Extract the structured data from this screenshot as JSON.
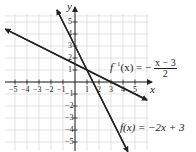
{
  "chart_data": {
    "type": "line",
    "title": "",
    "xlabel": "x",
    "ylabel": "y",
    "xlim": [
      -6,
      6
    ],
    "ylim": [
      -5.5,
      6
    ],
    "grid": true,
    "x_ticks": [
      "-5",
      "-4",
      "-3",
      "-2",
      "-1",
      "1",
      "2",
      "3",
      "4",
      "5"
    ],
    "y_ticks": [
      "5",
      "4",
      "3",
      "2",
      "1",
      "-1",
      "-2",
      "-3",
      "-4",
      "-5"
    ],
    "series": [
      {
        "name": "f(x) = -2x + 3",
        "equation": "f(x) = -2x + 3",
        "slope": -2,
        "intercept": 3,
        "points": [
          [
            -1.5,
            6
          ],
          [
            0,
            3
          ],
          [
            1,
            1
          ],
          [
            1.5,
            0
          ],
          [
            4.4,
            -5.8
          ]
        ],
        "color": "#222222"
      },
      {
        "name": "f^{-1}(x) = -(x-3)/2",
        "equation": "f^{-1}(x) = -(x - 3)/2",
        "slope": -0.5,
        "intercept": 1.5,
        "points": [
          [
            -5.8,
            4.4
          ],
          [
            0,
            1.5
          ],
          [
            1,
            1
          ],
          [
            3,
            0
          ],
          [
            6,
            -1.5
          ]
        ],
        "color": "#222222"
      }
    ],
    "annotations": [
      {
        "text": "f^{-1}(x) = -(x - 3)/2",
        "near": [
          3.5,
          1
        ]
      },
      {
        "text": "f(x) = -2x + 3",
        "near": [
          3.5,
          -4
        ]
      }
    ]
  },
  "labels": {
    "x_axis": "x",
    "y_axis": "y",
    "finv_prefix": "f",
    "finv_sup": "−1",
    "finv_arg": "(x) = −",
    "finv_num": "x − 3",
    "finv_den": "2",
    "f_label": "f(x) = −2x + 3"
  },
  "ticks": {
    "x": [
      {
        "label": "−5",
        "v": -5
      },
      {
        "label": "−4",
        "v": -4
      },
      {
        "label": "−3",
        "v": -3
      },
      {
        "label": "−2",
        "v": -2
      },
      {
        "label": "−1",
        "v": -1
      },
      {
        "label": "1",
        "v": 1
      },
      {
        "label": "2",
        "v": 2
      },
      {
        "label": "3",
        "v": 3
      },
      {
        "label": "4",
        "v": 4
      },
      {
        "label": "5",
        "v": 5
      }
    ],
    "y": [
      {
        "label": "5",
        "v": 5
      },
      {
        "label": "4",
        "v": 4
      },
      {
        "label": "3",
        "v": 3
      },
      {
        "label": "2",
        "v": 2
      },
      {
        "label": "1",
        "v": 1
      },
      {
        "label": "−1",
        "v": -1
      },
      {
        "label": "−2",
        "v": -2
      },
      {
        "label": "−3",
        "v": -3
      },
      {
        "label": "−4",
        "v": -4
      },
      {
        "label": "−5",
        "v": -5
      }
    ]
  }
}
